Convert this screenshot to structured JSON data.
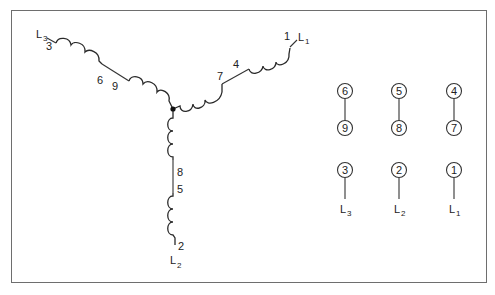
{
  "diagram": {
    "type": "wye-connected 9-lead motor winding",
    "junction": "center star point",
    "branches": {
      "l3": {
        "line_label": "L",
        "line_sub": "3",
        "lead_outer": "3",
        "lead_mid_a": "6",
        "lead_mid_b": "9"
      },
      "l1": {
        "line_label": "L",
        "line_sub": "1",
        "lead_outer": "1",
        "lead_mid_a": "4",
        "lead_mid_b": "7"
      },
      "l2": {
        "line_label": "L",
        "line_sub": "2",
        "lead_outer": "2",
        "lead_mid_a": "5",
        "lead_mid_b": "8"
      }
    }
  },
  "terminal_block": {
    "columns": [
      {
        "top": "6",
        "bottom": "9",
        "lead": "3",
        "line_label": "L",
        "line_sub": "3"
      },
      {
        "top": "5",
        "bottom": "8",
        "lead": "2",
        "line_label": "L",
        "line_sub": "2"
      },
      {
        "top": "4",
        "bottom": "7",
        "lead": "1",
        "line_label": "L",
        "line_sub": "1"
      }
    ]
  },
  "colors": {
    "line": "#333333",
    "frame": "#6e6e6e",
    "background": "#ffffff"
  }
}
